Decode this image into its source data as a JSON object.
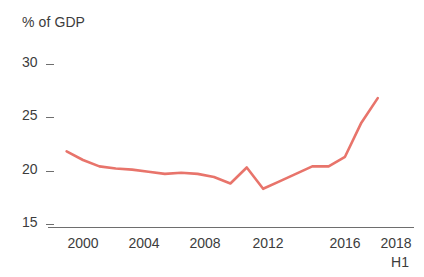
{
  "axis": {
    "unit_label": "% of GDP",
    "y_ticks": [
      "30",
      "25",
      "20",
      "15"
    ],
    "x_ticks": [
      "2000",
      "2004",
      "2008",
      "2012",
      "2016",
      "2018"
    ],
    "x_sub_label": "H1"
  },
  "colors": {
    "line": "#E8746B",
    "axis": "#6e6e6e",
    "text": "#3c3c3c",
    "background": "#ffffff"
  },
  "chart_data": {
    "type": "line",
    "title": "",
    "subtitle": "",
    "xlabel": "",
    "ylabel": "% of GDP",
    "ylim": [
      15,
      30
    ],
    "xlim": [
      1999,
      2018.5
    ],
    "grid": false,
    "legend": false,
    "y_tick_values": [
      30,
      25,
      20,
      15
    ],
    "x_tick_values": [
      2000,
      2004,
      2008,
      2012,
      2016,
      2018
    ],
    "x_tick_labels": [
      "2000",
      "2004",
      "2008",
      "2012",
      "2016",
      "2018"
    ],
    "x_axis_note": "H1",
    "series": [
      {
        "name": "% of GDP",
        "color": "#E8746B",
        "x": [
          1999,
          2000,
          2001,
          2002,
          2003,
          2004,
          2005,
          2006,
          2007,
          2008,
          2009,
          2010,
          2011,
          2012,
          2013,
          2014,
          2015,
          2016,
          2017,
          2018
        ],
        "values": [
          21.8,
          21.0,
          20.4,
          20.2,
          20.1,
          19.9,
          19.7,
          19.8,
          19.7,
          19.4,
          18.8,
          20.3,
          18.3,
          19.0,
          19.7,
          20.4,
          20.4,
          21.3,
          24.5,
          26.8
        ]
      }
    ]
  }
}
